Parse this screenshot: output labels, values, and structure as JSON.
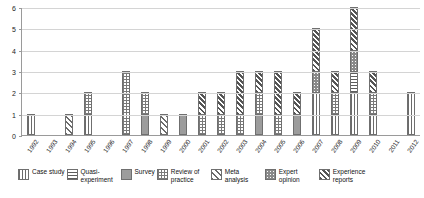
{
  "chart_data": {
    "type": "bar",
    "stacked": true,
    "title": "",
    "subtitle": "",
    "xlabel": "",
    "ylabel": "",
    "ylim": [
      0,
      6
    ],
    "yticks": [
      0,
      1,
      2,
      3,
      4,
      5,
      6
    ],
    "ytick_labels": [
      "0",
      "1",
      "2",
      "3",
      "4",
      "5",
      "6"
    ],
    "grid": true,
    "legend_position": "bottom",
    "categories": [
      "1992",
      "1993",
      "1994",
      "1995",
      "1996",
      "1997",
      "1998",
      "1999",
      "2000",
      "2001",
      "2002",
      "2003",
      "2004",
      "2005",
      "2006",
      "2007",
      "2008",
      "2009",
      "2010",
      "2011",
      "2012"
    ],
    "series": [
      {
        "name": "Case study",
        "pattern": "vertical-lines",
        "values": [
          1,
          0,
          0,
          1,
          0,
          0,
          0,
          0,
          0,
          0,
          0,
          0,
          0,
          0,
          0,
          2,
          1,
          2,
          1,
          0,
          2
        ]
      },
      {
        "name": "Quasi-experiment",
        "pattern": "horizontal-lines",
        "values": [
          0,
          0,
          0,
          0,
          0,
          0,
          0,
          0,
          0,
          0,
          0,
          0,
          0,
          0,
          0,
          0,
          0,
          1,
          0,
          0,
          0
        ]
      },
      {
        "name": "Survey",
        "pattern": "solid-gray",
        "values": [
          0,
          0,
          0,
          0,
          0,
          0,
          1,
          0,
          1,
          0,
          0,
          0,
          1,
          0,
          1,
          0,
          0,
          0,
          0,
          0,
          0
        ]
      },
      {
        "name": "Review of practice",
        "pattern": "grid-checker",
        "values": [
          0,
          0,
          0,
          1,
          0,
          3,
          1,
          0,
          0,
          1,
          1,
          1,
          1,
          1,
          0,
          0,
          1,
          0,
          1,
          0,
          0
        ]
      },
      {
        "name": "Meta analysis",
        "pattern": "diagonal-lines",
        "values": [
          0,
          0,
          1,
          0,
          0,
          0,
          0,
          1,
          0,
          0,
          0,
          0,
          0,
          0,
          0,
          0,
          0,
          0,
          0,
          0,
          0
        ]
      },
      {
        "name": "Expert opinion",
        "pattern": "dotted-stipple",
        "values": [
          0,
          0,
          0,
          0,
          0,
          0,
          0,
          0,
          0,
          0,
          0,
          0,
          0,
          0,
          0,
          1,
          0,
          1,
          0,
          0,
          0
        ]
      },
      {
        "name": "Experience reports",
        "pattern": "dense-diagonal",
        "values": [
          0,
          0,
          0,
          0,
          0,
          0,
          0,
          0,
          0,
          1,
          1,
          2,
          1,
          2,
          1,
          2,
          1,
          2,
          1,
          0,
          0
        ]
      }
    ],
    "totals": [
      1,
      0,
      1,
      2,
      0,
      3,
      2,
      1,
      1,
      2,
      2,
      3,
      3,
      3,
      2,
      5,
      3,
      6,
      3,
      0,
      2
    ]
  },
  "legend": {
    "items": [
      {
        "label": "Case study",
        "key": "case-study"
      },
      {
        "label": "Quasi-experiment",
        "key": "quasi-experiment"
      },
      {
        "label": "Survey",
        "key": "survey"
      },
      {
        "label": "Review of practice",
        "key": "review-of-practice"
      },
      {
        "label": "Meta analysis",
        "key": "meta-analysis"
      },
      {
        "label": "Expert opinion",
        "key": "expert-opinion"
      },
      {
        "label": "Experience reports",
        "key": "experience-reports"
      }
    ]
  },
  "colors": {
    "axis": "#9a9a9a",
    "gridline": "#d4d4d4",
    "bar_outline": "#6f6f6f",
    "background": "#ffffff",
    "text": "#111111"
  }
}
